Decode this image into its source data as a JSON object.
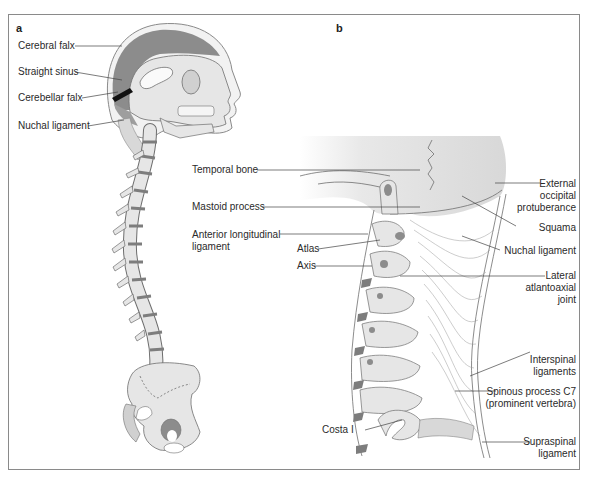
{
  "panels": {
    "a": {
      "letter": "a",
      "labels": {
        "cerebral_falx": "Cerebral falx",
        "straight_sinus": "Straight sinus",
        "cerebellar_falx": "Cerebellar falx",
        "nuchal_ligament": "Nuchal ligament"
      }
    },
    "b": {
      "letter": "b",
      "labels": {
        "temporal_bone": "Temporal bone",
        "mastoid_process": "Mastoid process",
        "anterior_longitudinal_1": "Anterior longitudinal",
        "anterior_longitudinal_2": "ligament",
        "atlas": "Atlas",
        "axis": "Axis",
        "external_occipital_1": "External",
        "external_occipital_2": "occipital",
        "external_occipital_3": "protuberance",
        "squama": "Squama",
        "nuchal_ligament": "Nuchal ligament",
        "lateral_atlantoaxial_1": "Lateral",
        "lateral_atlantoaxial_2": "atlantoaxial",
        "lateral_atlantoaxial_3": "joint",
        "interspinal_1": "Interspinal",
        "interspinal_2": "ligaments",
        "spinous_c7_1": "Spinous process C7",
        "spinous_c7_2": "(prominent vertebra)",
        "costa_i": "Costa I",
        "supraspinal_1": "Supraspinal",
        "supraspinal_2": "ligament"
      }
    }
  },
  "colors": {
    "bone": "#e6e6e6",
    "dark_gray": "#8c8c8c",
    "mid_gray": "#b5b5b5",
    "outline": "#6e6e6e",
    "disc": "#7d7d7d",
    "frame": "#8a8a8a",
    "text": "#2a2a2a"
  }
}
